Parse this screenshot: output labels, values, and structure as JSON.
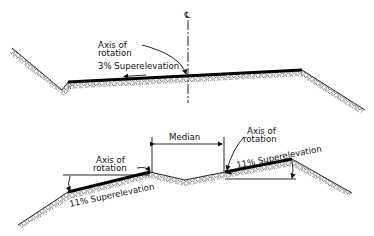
{
  "top_section": {
    "centerline_symbol": "℄",
    "axis_label_line1": "Axis of",
    "axis_label_line2": "rotation",
    "superelevation_label": "3% Superelevation"
  },
  "bottom_section": {
    "median_label": "Median",
    "left_axis_label_line1": "Axis of",
    "left_axis_label_line2": "rotation",
    "right_axis_label_line1": "Axis of",
    "right_axis_label_line2": "rotation",
    "left_superelevation_label": "11% Superelevation",
    "right_superelevation_label": "11% Superelevation"
  },
  "colors": {
    "ink": "#111111",
    "background": "#ffffff"
  }
}
